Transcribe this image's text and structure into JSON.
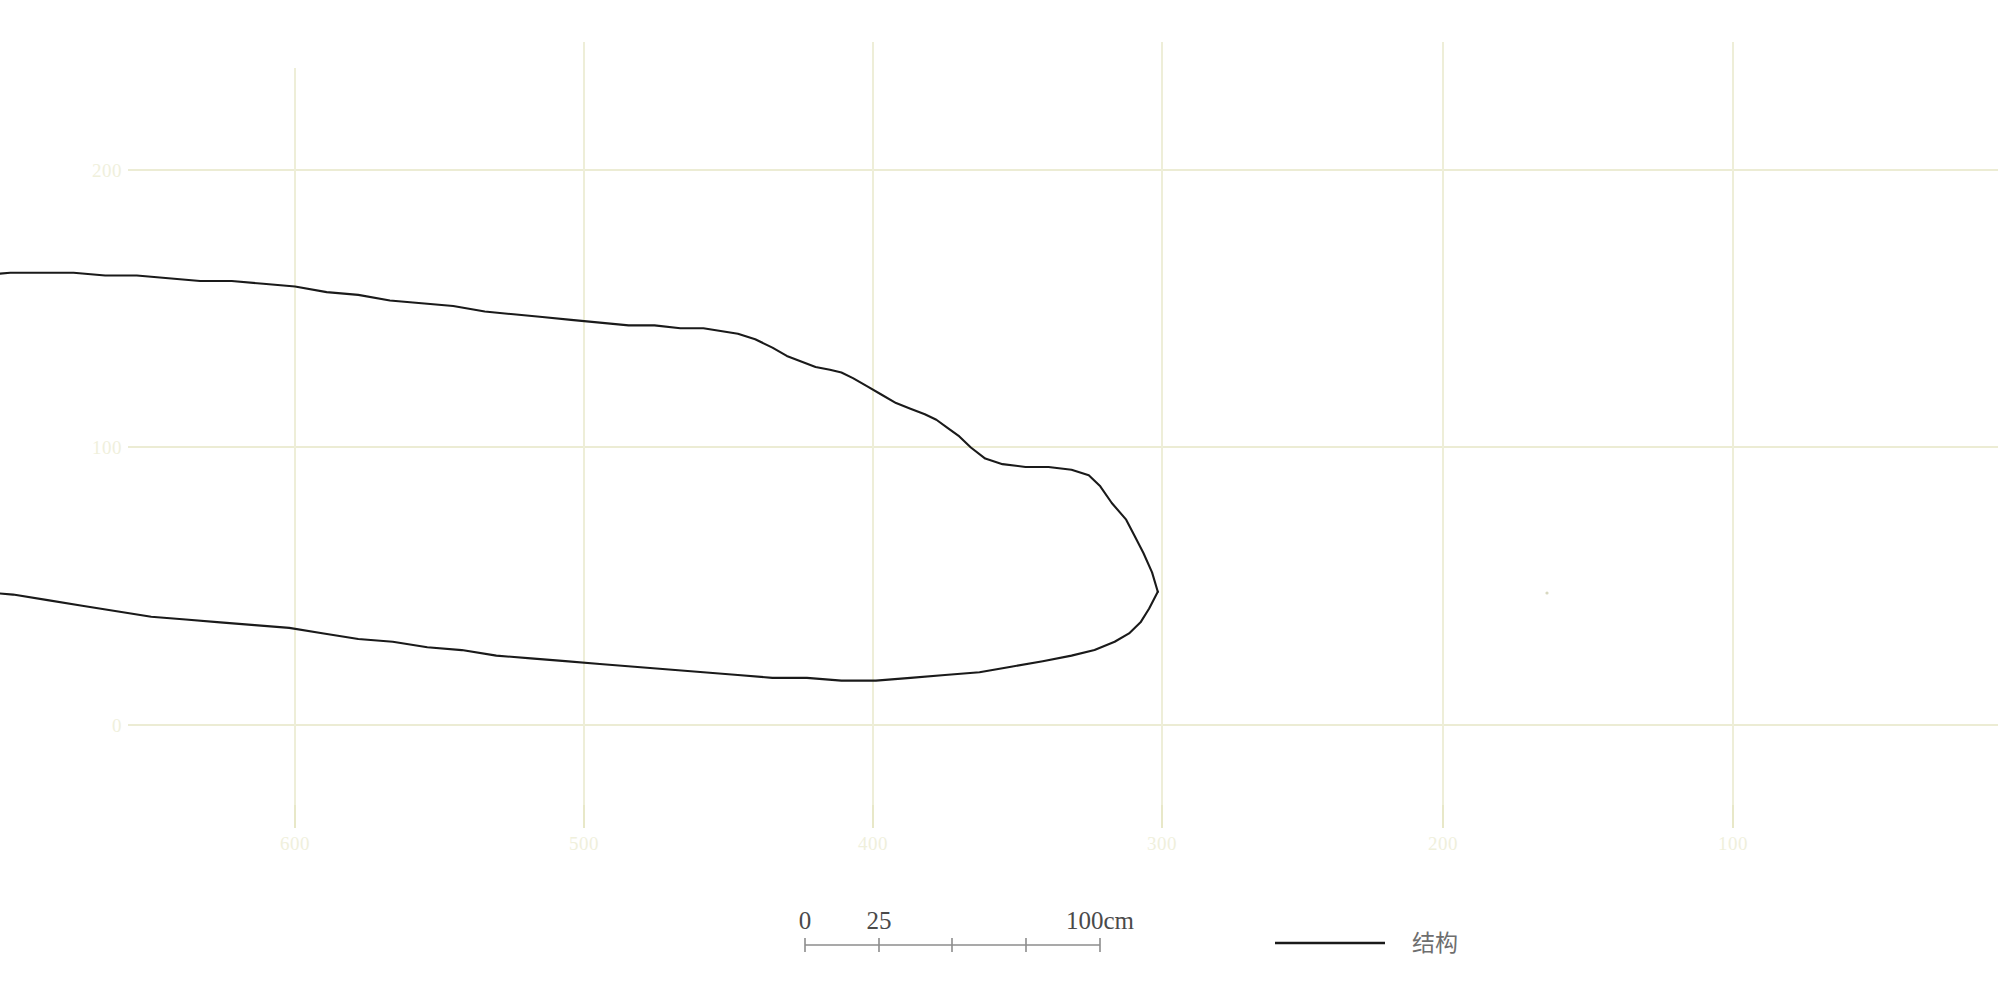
{
  "figure": {
    "title": "",
    "background_color": "#ffffff",
    "grid_color": "#eeeed8",
    "axis_label_color": "#f0f0dc",
    "series_color": "#1a1a1a"
  },
  "chart_data": {
    "type": "line",
    "title": "",
    "xlabel": "",
    "ylabel": "",
    "grid": true,
    "legend_position": "bottom-right",
    "xlim": [
      640,
      60
    ],
    "ylim": [
      -20,
      230
    ],
    "x_ticks": [
      600,
      500,
      400,
      300,
      200,
      100
    ],
    "x_tick_labels": [
      "600",
      "500",
      "400",
      "300",
      "200",
      "100"
    ],
    "y_ticks": [
      0,
      100,
      200
    ],
    "y_tick_labels": [
      "0",
      "100",
      "200"
    ],
    "series": [
      {
        "name": "结构",
        "role": "upper-outline",
        "color": "#1a1a1a",
        "points": [
          [
            300,
            48
          ],
          [
            302,
            55
          ],
          [
            305,
            62
          ],
          [
            308,
            68
          ],
          [
            311,
            74
          ],
          [
            316,
            80
          ],
          [
            320,
            86
          ],
          [
            324,
            90
          ],
          [
            330,
            92
          ],
          [
            338,
            93
          ],
          [
            346,
            93
          ],
          [
            354,
            94
          ],
          [
            360,
            96
          ],
          [
            365,
            100
          ],
          [
            369,
            104
          ],
          [
            373,
            107
          ],
          [
            377,
            110
          ],
          [
            381,
            112
          ],
          [
            386,
            114
          ],
          [
            391,
            116
          ],
          [
            396,
            119
          ],
          [
            401,
            122
          ],
          [
            406,
            125
          ],
          [
            410,
            127
          ],
          [
            414,
            128
          ],
          [
            419,
            129
          ],
          [
            424,
            131
          ],
          [
            429,
            133
          ],
          [
            434,
            136
          ],
          [
            440,
            139
          ],
          [
            446,
            141
          ],
          [
            452,
            142
          ],
          [
            458,
            143
          ],
          [
            466,
            143
          ],
          [
            475,
            144
          ],
          [
            484,
            144
          ],
          [
            494,
            145
          ],
          [
            504,
            146
          ],
          [
            514,
            147
          ],
          [
            524,
            148
          ],
          [
            534,
            149
          ],
          [
            545,
            151
          ],
          [
            556,
            152
          ],
          [
            567,
            153
          ],
          [
            578,
            155
          ],
          [
            589,
            156
          ],
          [
            600,
            158
          ],
          [
            611,
            159
          ],
          [
            622,
            160
          ],
          [
            633,
            160
          ],
          [
            644,
            161
          ],
          [
            655,
            162
          ],
          [
            666,
            162
          ],
          [
            677,
            163
          ],
          [
            688,
            163
          ],
          [
            699,
            163
          ],
          [
            710,
            162
          ],
          [
            721,
            162
          ],
          [
            732,
            161
          ],
          [
            743,
            161
          ],
          [
            754,
            160
          ],
          [
            765,
            160
          ],
          [
            776,
            159
          ],
          [
            787,
            159
          ],
          [
            798,
            160
          ],
          [
            809,
            160
          ],
          [
            820,
            161
          ],
          [
            831,
            161
          ],
          [
            842,
            162
          ],
          [
            853,
            161
          ],
          [
            864,
            160
          ],
          [
            875,
            159
          ],
          [
            886,
            158
          ],
          [
            897,
            157
          ],
          [
            908,
            156
          ],
          [
            919,
            155
          ],
          [
            930,
            154
          ],
          [
            941,
            154
          ],
          [
            952,
            153
          ],
          [
            963,
            153
          ],
          [
            974,
            152
          ],
          [
            985,
            152
          ],
          [
            996,
            152
          ]
        ]
      },
      {
        "name": "结构",
        "role": "lower-outline",
        "color": "#1a1a1a",
        "points": [
          [
            300,
            48
          ],
          [
            303,
            42
          ],
          [
            306,
            37
          ],
          [
            310,
            33
          ],
          [
            315,
            30
          ],
          [
            322,
            27
          ],
          [
            330,
            25
          ],
          [
            340,
            23
          ],
          [
            351,
            21
          ],
          [
            362,
            19
          ],
          [
            374,
            18
          ],
          [
            386,
            17
          ],
          [
            398,
            16
          ],
          [
            410,
            16
          ],
          [
            422,
            17
          ],
          [
            434,
            17
          ],
          [
            446,
            18
          ],
          [
            458,
            19
          ],
          [
            470,
            20
          ],
          [
            482,
            21
          ],
          [
            494,
            22
          ],
          [
            506,
            23
          ],
          [
            518,
            24
          ],
          [
            530,
            25
          ],
          [
            542,
            27
          ],
          [
            554,
            28
          ],
          [
            566,
            30
          ],
          [
            578,
            31
          ],
          [
            590,
            33
          ],
          [
            602,
            35
          ],
          [
            614,
            36
          ],
          [
            626,
            37
          ],
          [
            638,
            38
          ],
          [
            650,
            39
          ],
          [
            662,
            41
          ],
          [
            674,
            43
          ],
          [
            686,
            45
          ],
          [
            698,
            47
          ],
          [
            710,
            48
          ],
          [
            722,
            49
          ],
          [
            734,
            50
          ],
          [
            746,
            51
          ],
          [
            758,
            52
          ],
          [
            770,
            53
          ],
          [
            782,
            54
          ],
          [
            794,
            55
          ],
          [
            806,
            56
          ],
          [
            818,
            57
          ],
          [
            830,
            58
          ],
          [
            842,
            58
          ],
          [
            854,
            59
          ],
          [
            866,
            58
          ],
          [
            878,
            57
          ],
          [
            890,
            56
          ],
          [
            902,
            55
          ],
          [
            914,
            55
          ],
          [
            926,
            56
          ],
          [
            938,
            57
          ],
          [
            950,
            58
          ],
          [
            962,
            59
          ],
          [
            974,
            60
          ],
          [
            985,
            61
          ],
          [
            996,
            62
          ]
        ]
      }
    ],
    "scale_bar": {
      "unit": "cm",
      "labels": [
        "0",
        "25",
        "100cm"
      ],
      "tick_values": [
        0,
        25,
        50,
        75,
        100
      ],
      "length_label": "100cm"
    },
    "legend": [
      {
        "label": "结构",
        "color": "#1a1a1a",
        "marker": "line"
      }
    ]
  },
  "scale_bar": {
    "label_0": "0",
    "label_25": "25",
    "label_100": "100cm"
  },
  "legend": {
    "entry_label": "结构"
  },
  "y_axis": {
    "labels": [
      "200",
      "100",
      "0"
    ]
  },
  "x_axis": {
    "labels": [
      "600",
      "500",
      "400",
      "300",
      "200",
      "100"
    ]
  }
}
